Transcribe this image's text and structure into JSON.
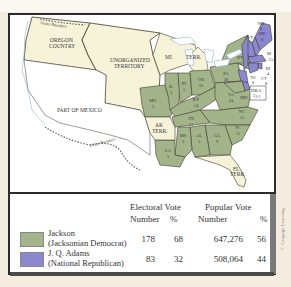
{
  "map": {
    "colors": {
      "jackson": "#a4b48a",
      "adams": "#8c88d0",
      "territory": "#f7f3d9",
      "water": "#ffffff",
      "border": "#3d3d2c"
    },
    "region_labels": {
      "oregon": [
        "OREGON",
        "COUNTRY"
      ],
      "unorganized": [
        "UNORGANIZED",
        "TERRITORY"
      ],
      "mexico": "PART OF MEXICO",
      "treaty_north": "Treaty Boundary",
      "treaty_south": "Treaty Boundary",
      "mi": "MI",
      "mi_terr": "TERR.",
      "ar_terr": [
        "AR",
        "TERR."
      ],
      "fl_terr": [
        "FL",
        "TERR."
      ]
    },
    "states": [
      {
        "abbr": "ME",
        "votes": "8",
        "winner": "adams"
      },
      {
        "abbr": "NH",
        "votes": "8",
        "winner": "adams"
      },
      {
        "abbr": "VT",
        "votes": "7",
        "winner": "adams"
      },
      {
        "abbr": "NY",
        "votes": "36",
        "split": "20",
        "winner": "jackson"
      },
      {
        "abbr": "MA",
        "votes": "15",
        "winner": "adams"
      },
      {
        "abbr": "RI",
        "votes": "4",
        "winner": "adams"
      },
      {
        "abbr": "CT",
        "votes": "8",
        "winner": "adams"
      },
      {
        "abbr": "NJ",
        "votes": "8",
        "winner": "adams"
      },
      {
        "abbr": "DE",
        "votes": "3",
        "winner": "adams"
      },
      {
        "abbr": "MD",
        "votes": "A-6 J-5",
        "winner": "split"
      },
      {
        "abbr": "PA",
        "votes": "28",
        "winner": "jackson"
      },
      {
        "abbr": "OH",
        "votes": "16",
        "winner": "jackson"
      },
      {
        "abbr": "IN",
        "votes": "5",
        "winner": "jackson"
      },
      {
        "abbr": "IL",
        "votes": "3",
        "winner": "jackson"
      },
      {
        "abbr": "MO",
        "votes": "3",
        "winner": "jackson"
      },
      {
        "abbr": "KY",
        "votes": "14",
        "winner": "jackson"
      },
      {
        "abbr": "VA",
        "votes": "24",
        "winner": "jackson"
      },
      {
        "abbr": "NC",
        "votes": "15",
        "winner": "jackson"
      },
      {
        "abbr": "TN",
        "votes": "11",
        "winner": "jackson"
      },
      {
        "abbr": "SC",
        "votes": "11",
        "winner": "jackson"
      },
      {
        "abbr": "GA",
        "votes": "9",
        "winner": "jackson"
      },
      {
        "abbr": "AL",
        "votes": "5",
        "winner": "jackson"
      },
      {
        "abbr": "MS",
        "votes": "3",
        "winner": "jackson"
      },
      {
        "abbr": "LA",
        "votes": "5",
        "winner": "jackson"
      }
    ]
  },
  "legend": {
    "headers": {
      "electoral": "Electoral Vote",
      "popular": "Popular Vote",
      "number": "Number",
      "percent": "%"
    },
    "rows": [
      {
        "name": "Jackson",
        "party": "(Jacksonian Democrat)",
        "electoral_number": "178",
        "electoral_percent": "68",
        "popular_number": "647,276",
        "popular_percent": "56",
        "color": "#a4b48a"
      },
      {
        "name": "J. Q. Adams",
        "party": "(National Republican)",
        "electoral_number": "83",
        "electoral_percent": "32",
        "popular_number": "508,064",
        "popular_percent": "44",
        "color": "#8c88d0"
      }
    ]
  },
  "copyright": "© Cengage Learning"
}
